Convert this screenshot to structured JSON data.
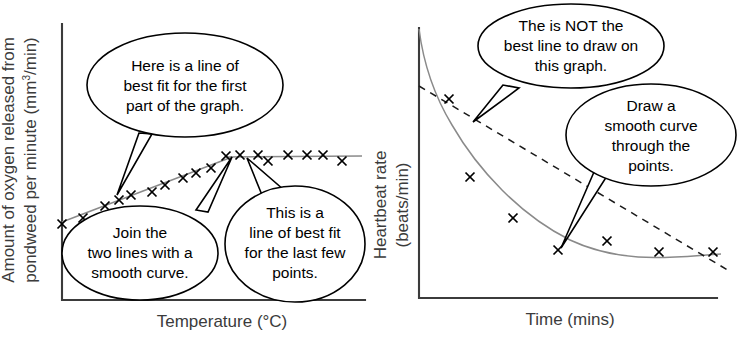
{
  "figure": {
    "background": "#ffffff",
    "ink_color": "#000000",
    "trend_color": "#8a8a8a",
    "axis_color": "#3b3b3b"
  },
  "panels": [
    {
      "id": "pondweed",
      "y_axis_label_line1": "Amount of oxygen released from",
      "y_axis_label_line2_pre": "pondweed per minute (mm",
      "y_axis_label_line2_sup": "3",
      "y_axis_label_line2_post": "/min)",
      "x_axis_label": "Temperature (°C)",
      "bubbles": [
        {
          "name": "bubble-first-part",
          "lines": [
            "Here is a line of",
            "best fit for the first",
            "part of the graph."
          ]
        },
        {
          "name": "bubble-join-curve",
          "lines": [
            "Join the",
            "two lines with a",
            "smooth curve."
          ]
        },
        {
          "name": "bubble-last-points",
          "lines": [
            "This is a",
            "line of best fit",
            "for the last few",
            "points."
          ]
        }
      ]
    },
    {
      "id": "heartbeat",
      "y_axis_label_line1": "Heartbeat rate",
      "y_axis_label_line2": "(beats/min)",
      "x_axis_label": "Time (mins)",
      "bubbles": [
        {
          "name": "bubble-not-best-line",
          "lines": [
            "The is NOT the",
            "best line to draw on",
            "this graph."
          ]
        },
        {
          "name": "bubble-smooth-curve",
          "lines": [
            "Draw a",
            "smooth curve",
            "through the",
            "points."
          ]
        }
      ]
    }
  ],
  "chart_data": [
    {
      "type": "scatter",
      "id": "pondweed-graph",
      "title": "",
      "xlabel": "Temperature (°C)",
      "ylabel": "Amount of oxygen released from pondweed per minute (mm3/min)",
      "grid": false,
      "legend": "none",
      "axis_ticks": "none",
      "points": [
        {
          "x": 62,
          "y": 224
        },
        {
          "x": 83,
          "y": 218
        },
        {
          "x": 105,
          "y": 206
        },
        {
          "x": 119,
          "y": 200
        },
        {
          "x": 131,
          "y": 195
        },
        {
          "x": 152,
          "y": 192
        },
        {
          "x": 165,
          "y": 185
        },
        {
          "x": 183,
          "y": 178
        },
        {
          "x": 196,
          "y": 173
        },
        {
          "x": 211,
          "y": 168
        },
        {
          "x": 226,
          "y": 156
        },
        {
          "x": 240,
          "y": 155
        },
        {
          "x": 258,
          "y": 155
        },
        {
          "x": 268,
          "y": 161
        },
        {
          "x": 288,
          "y": 155
        },
        {
          "x": 307,
          "y": 155
        },
        {
          "x": 323,
          "y": 155
        },
        {
          "x": 342,
          "y": 161
        }
      ],
      "fit_lines": [
        {
          "name": "first-part-best-fit",
          "kind": "straight",
          "x1": 62,
          "y1": 222,
          "x2": 232,
          "y2": 157
        },
        {
          "name": "last-points-best-fit",
          "kind": "straight",
          "x1": 226,
          "y1": 157,
          "x2": 362,
          "y2": 156
        }
      ]
    },
    {
      "type": "scatter",
      "id": "heartbeat-graph",
      "title": "",
      "xlabel": "Time (mins)",
      "ylabel": "Heartbeat rate (beats/min)",
      "grid": false,
      "legend": "none",
      "axis_ticks": "none",
      "points": [
        {
          "x": 449,
          "y": 99
        },
        {
          "x": 470,
          "y": 177
        },
        {
          "x": 513,
          "y": 218
        },
        {
          "x": 558,
          "y": 250
        },
        {
          "x": 607,
          "y": 241
        },
        {
          "x": 659,
          "y": 252
        },
        {
          "x": 713,
          "y": 252
        }
      ],
      "fit_lines": [
        {
          "name": "smooth-curve",
          "kind": "curve",
          "path": "M 419,29 C 423,60 432,92 452,125 C 478,170 520,215 570,240 C 625,266 680,256 721,254"
        },
        {
          "name": "straight-line-not-best",
          "kind": "dashed-straight",
          "x1": 419,
          "y1": 86,
          "x2": 731,
          "y2": 272
        }
      ]
    }
  ]
}
